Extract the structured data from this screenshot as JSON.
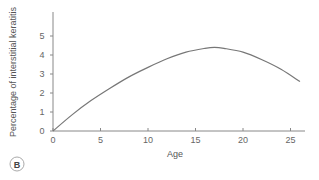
{
  "panel_label": "B",
  "chart_data": {
    "type": "line",
    "title": "",
    "xlabel": "Age",
    "ylabel": "Percentage of interstitial keratitis",
    "xlim": [
      0,
      27
    ],
    "ylim": [
      0,
      6
    ],
    "x_ticks": [
      0,
      5,
      10,
      15,
      20,
      25
    ],
    "y_ticks": [
      0,
      1,
      2,
      3,
      4,
      5
    ],
    "grid": false,
    "legend": null,
    "series": [
      {
        "name": "Interstitial keratitis",
        "x": [
          0,
          2,
          4,
          6,
          8,
          10,
          12,
          14,
          16,
          17,
          18,
          20,
          22,
          24,
          26
        ],
        "values": [
          0,
          0.85,
          1.6,
          2.25,
          2.85,
          3.35,
          3.8,
          4.15,
          4.35,
          4.4,
          4.35,
          4.15,
          3.75,
          3.25,
          2.6
        ]
      }
    ]
  }
}
